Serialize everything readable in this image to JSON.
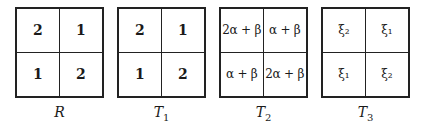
{
  "panels": [
    {
      "label": "R",
      "sub": "",
      "style": "bold",
      "cells": [
        "2",
        "1",
        "1",
        "2"
      ]
    },
    {
      "label": "T",
      "sub": "1",
      "style": "bold",
      "cells": [
        "2",
        "1",
        "1",
        "2"
      ]
    },
    {
      "label": "T",
      "sub": "2",
      "style": "math",
      "cells": [
        "2α + β",
        "α + β",
        "α + β",
        "2α + β"
      ]
    },
    {
      "label": "T",
      "sub": "3",
      "style": "math",
      "cells": [
        "ξ₂",
        "ξ₁",
        "ξ₁",
        "ξ₂"
      ]
    }
  ]
}
